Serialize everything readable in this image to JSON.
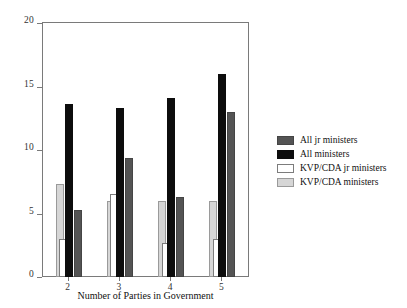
{
  "chart_data": {
    "type": "bar",
    "title": "",
    "xlabel": "Number of Parties in Government",
    "ylabel": "",
    "categories": [
      "2",
      "3",
      "4",
      "5"
    ],
    "ylim": [
      0,
      20
    ],
    "yticks": [
      0,
      5,
      10,
      15,
      20
    ],
    "ytick_labels": [
      "0",
      "5",
      "10",
      "15",
      "20"
    ],
    "grid": false,
    "legend_position": "right",
    "series": [
      {
        "name": "All jr ministers",
        "key": "all-jr",
        "color": "#545454",
        "values": [
          5.3,
          9.4,
          6.3,
          13.0
        ]
      },
      {
        "name": "All ministers",
        "key": "all-ministers",
        "color": "#0d0d0d",
        "values": [
          13.6,
          13.3,
          14.1,
          16.0
        ]
      },
      {
        "name": "KVP/CDA jr ministers",
        "key": "kvpcda-jr",
        "color": "#ffffff",
        "values": [
          3.0,
          6.5,
          2.7,
          3.0
        ]
      },
      {
        "name": "KVP/CDA ministers",
        "key": "kvpcda-ministers",
        "color": "#d6d6d6",
        "values": [
          7.3,
          6.0,
          6.0,
          6.0
        ]
      }
    ]
  },
  "axes": {
    "x_title": "Number of Parties in Government",
    "y_tick_labels": [
      "0",
      "5",
      "10",
      "15",
      "20"
    ],
    "x_tick_labels": [
      "2",
      "3",
      "4",
      "5"
    ]
  },
  "legend": {
    "entries": [
      {
        "label": "All jr ministers",
        "swatch": "all-jr"
      },
      {
        "label": "All ministers",
        "swatch": "all-ministers"
      },
      {
        "label": "KVP/CDA jr ministers",
        "swatch": "kvpcda-jr"
      },
      {
        "label": "KVP/CDA ministers",
        "swatch": "kvpcda-ministers"
      }
    ]
  }
}
